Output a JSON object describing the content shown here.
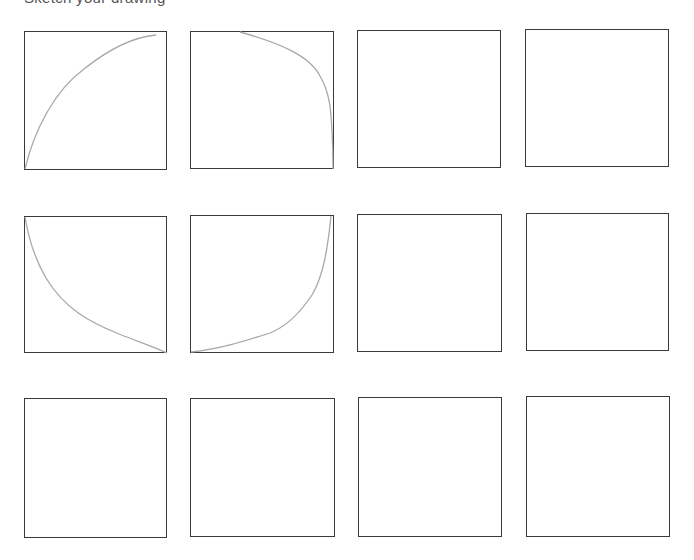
{
  "header": {
    "cropped_title": "Sketch your drawing",
    "note": "title text is cut off at the top edge; only descenders visible"
  },
  "grid": {
    "rows": 3,
    "columns": 4,
    "border_color": "#3a3a3a",
    "curve_color": "#a8a8a8",
    "panels": [
      {
        "id": 1,
        "row": 1,
        "col": 1,
        "x": 24,
        "y": 31,
        "w": 143,
        "h": 139,
        "curve": "concave-increasing",
        "path": "M1,138 C10,100 30,60 60,38 C85,18 110,6 132,4"
      },
      {
        "id": 2,
        "row": 1,
        "col": 2,
        "x": 190,
        "y": 31,
        "w": 144,
        "h": 138,
        "curve": "concave-decreasing",
        "path": "M50,1 C90,12 120,25 130,45 C140,62 141,80 142,100 C143,120 143,130 143,138"
      },
      {
        "id": 3,
        "row": 1,
        "col": 3,
        "x": 357,
        "y": 30,
        "w": 144,
        "h": 138,
        "curve": "none",
        "path": ""
      },
      {
        "id": 4,
        "row": 1,
        "col": 4,
        "x": 525,
        "y": 29,
        "w": 144,
        "h": 138,
        "curve": "none",
        "path": ""
      },
      {
        "id": 5,
        "row": 2,
        "col": 1,
        "x": 24,
        "y": 216,
        "w": 143,
        "h": 137,
        "curve": "convex-decreasing",
        "path": "M1,1 C5,25 12,45 22,62 C40,92 65,106 95,118 C115,126 130,131 143,137"
      },
      {
        "id": 6,
        "row": 2,
        "col": 2,
        "x": 190,
        "y": 215,
        "w": 144,
        "h": 138,
        "curve": "convex-increasing",
        "path": "M1,137 C30,134 55,126 80,118 C95,112 110,98 122,80 C134,60 138,30 141,1"
      },
      {
        "id": 7,
        "row": 2,
        "col": 3,
        "x": 357,
        "y": 214,
        "w": 145,
        "h": 138,
        "curve": "none",
        "path": ""
      },
      {
        "id": 8,
        "row": 2,
        "col": 4,
        "x": 526,
        "y": 213,
        "w": 143,
        "h": 138,
        "curve": "none",
        "path": ""
      },
      {
        "id": 9,
        "row": 3,
        "col": 1,
        "x": 24,
        "y": 398,
        "w": 143,
        "h": 140,
        "curve": "none",
        "path": ""
      },
      {
        "id": 10,
        "row": 3,
        "col": 2,
        "x": 190,
        "y": 398,
        "w": 145,
        "h": 139,
        "curve": "none",
        "path": ""
      },
      {
        "id": 11,
        "row": 3,
        "col": 3,
        "x": 358,
        "y": 397,
        "w": 144,
        "h": 140,
        "curve": "none",
        "path": ""
      },
      {
        "id": 12,
        "row": 3,
        "col": 4,
        "x": 526,
        "y": 396,
        "w": 144,
        "h": 141,
        "curve": "none",
        "path": ""
      }
    ]
  }
}
